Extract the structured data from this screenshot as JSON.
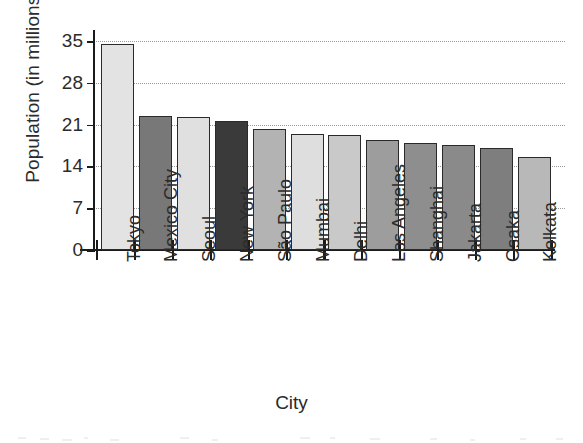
{
  "chart_data": {
    "type": "bar",
    "title": "",
    "xlabel": "City",
    "ylabel": "Population (in millions)",
    "categories": [
      "Tokyo",
      "Mexico City",
      "Seoul",
      "New York",
      "São Paulo",
      "Mumbai",
      "Delhi",
      "Los Angeles",
      "Shanghai",
      "Jakarta",
      "Osaka",
      "Kolkata"
    ],
    "values": [
      34.5,
      22.4,
      22.2,
      21.6,
      20.2,
      19.5,
      19.3,
      18.4,
      17.9,
      17.5,
      17.1,
      15.6
    ],
    "ylim": [
      0,
      36.5
    ],
    "yticks": [
      0,
      7,
      14,
      21,
      28,
      35
    ],
    "ytick_labels": [
      "0",
      "7",
      "14",
      "21",
      "28",
      "35"
    ],
    "grid": true,
    "grid_axis": "y",
    "grid_style": "dotted",
    "legend": "none",
    "bar_colors": [
      "#e3e3e3",
      "#787878",
      "#e0e0e0",
      "#3a3a3a",
      "#b3b3b3",
      "#dedede",
      "#c9c9c9",
      "#9d9d9d",
      "#8e8e8e",
      "#8a8a8a",
      "#7e7e7e",
      "#b8b8b8"
    ],
    "bar_edge_color": "#2a2a2a",
    "axis_color": "#1a1a1a",
    "grid_color": "#9a9a9a",
    "text_color": "#2b2b2b",
    "background": "#ffffff"
  }
}
